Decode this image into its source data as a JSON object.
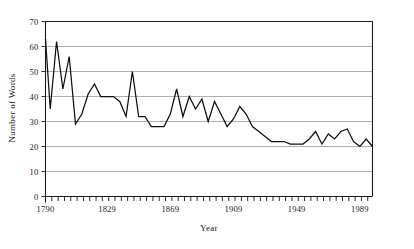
{
  "figure": {
    "background_color": "#ffffff",
    "line_color": "#101010",
    "grid_color": "#9a9a9a",
    "axis_color": "#1a1a1a"
  },
  "chart_data": {
    "type": "line",
    "title": "",
    "xlabel": "Year",
    "ylabel": "Number of Words",
    "xlim": [
      1790,
      1997
    ],
    "ylim": [
      0,
      70
    ],
    "grid": true,
    "legend": null,
    "y_ticks": [
      0,
      10,
      20,
      30,
      40,
      50,
      60,
      70
    ],
    "y_tick_labels": [
      "0",
      "10",
      "20",
      "30",
      "40",
      "50",
      "60",
      "70"
    ],
    "x_ticks": [
      1790,
      1829,
      1869,
      1909,
      1949,
      1989
    ],
    "x_tick_labels": [
      "1790",
      "1829",
      "1869",
      "1909",
      "1949",
      "1989"
    ],
    "x_minor_tick_step": 4,
    "series": [
      {
        "name": "Number of Words",
        "x": [
          1790,
          1793,
          1797,
          1801,
          1805,
          1809,
          1813,
          1817,
          1821,
          1825,
          1829,
          1833,
          1837,
          1841,
          1845,
          1849,
          1853,
          1857,
          1861,
          1865,
          1869,
          1873,
          1877,
          1881,
          1885,
          1889,
          1893,
          1897,
          1901,
          1905,
          1909,
          1913,
          1917,
          1921,
          1925,
          1929,
          1933,
          1937,
          1941,
          1945,
          1949,
          1953,
          1957,
          1961,
          1965,
          1969,
          1973,
          1977,
          1981,
          1985,
          1989,
          1993,
          1997
        ],
        "values": [
          63,
          35,
          62,
          43,
          56,
          29,
          33,
          41,
          45,
          40,
          40,
          40,
          38,
          32,
          50,
          32,
          32,
          28,
          28,
          28,
          33,
          43,
          32,
          40,
          35,
          39,
          30,
          38,
          33,
          28,
          31,
          36,
          33,
          28,
          26,
          24,
          22,
          22,
          22,
          21,
          21,
          21,
          23,
          26,
          21,
          25,
          23,
          26,
          27,
          22,
          20,
          23,
          20
        ]
      }
    ]
  },
  "axis_labels": {
    "y_title": "Number of Words",
    "x_title": "Year"
  }
}
